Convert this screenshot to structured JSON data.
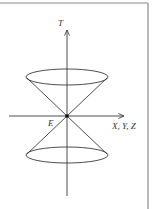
{
  "diagram": {
    "type": "light-cone",
    "labels": {
      "time_axis": "T",
      "space_axes": "X, Y, Z",
      "event": "E"
    },
    "colors": {
      "line": "#3a3a3a",
      "frame": "#8a8a8a",
      "background": "#ffffff"
    }
  }
}
